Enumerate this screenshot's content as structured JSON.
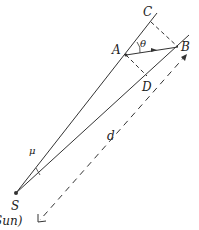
{
  "diagram": {
    "labels": {
      "C": "C",
      "A": "A",
      "theta": "θ",
      "B": "B",
      "D": "D",
      "d": "d",
      "mu": "μ",
      "S": "S",
      "sun": "Sun)"
    },
    "colors": {
      "line": "#333333",
      "background": "#ffffff"
    }
  }
}
